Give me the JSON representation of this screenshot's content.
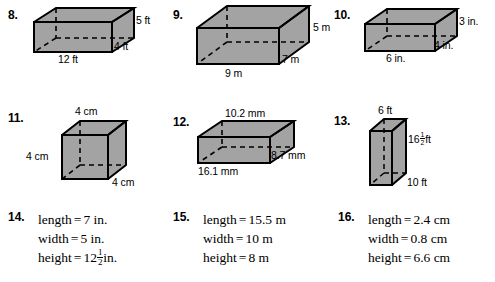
{
  "worksheet": {
    "fill_color": "#a3a3a3",
    "stroke_color": "#000000",
    "problems": [
      {
        "number": "8.",
        "shape": "rectangular-prism",
        "labels": {
          "bottom": "12 ft",
          "right_depth": "4 ft",
          "right_height": "5 ft"
        }
      },
      {
        "number": "9.",
        "shape": "rectangular-prism",
        "labels": {
          "bottom": "9 m",
          "right_depth": "7 m",
          "right_height": "5 m"
        }
      },
      {
        "number": "10.",
        "shape": "rectangular-prism",
        "labels": {
          "bottom": "6 in.",
          "right_depth": "4 in.",
          "right_height": "3 in."
        }
      },
      {
        "number": "11.",
        "shape": "cube",
        "labels": {
          "top": "4 cm",
          "left_height": "4 cm",
          "right_depth": "4 cm"
        }
      },
      {
        "number": "12.",
        "shape": "rectangular-prism",
        "labels": {
          "top": "10.2 mm",
          "bottom": "16.1 mm",
          "right_depth": "8.7 mm"
        }
      },
      {
        "number": "13.",
        "shape": "tall-rectangular-prism",
        "labels": {
          "top": "6 ft",
          "right_height_whole": "16",
          "right_height_num": "1",
          "right_height_den": "2",
          "right_height_unit": "ft",
          "bottom_right": "10 ft"
        }
      }
    ],
    "word_problems": [
      {
        "number": "14.",
        "lines": [
          {
            "label": "length",
            "eq": "=",
            "value": "7 in."
          },
          {
            "label": "width",
            "eq": "=",
            "value": "5 in."
          },
          {
            "label": "height",
            "eq": "=",
            "value_whole": "12",
            "num": "1",
            "den": "2",
            "unit": "in."
          }
        ]
      },
      {
        "number": "15.",
        "lines": [
          {
            "label": "length",
            "eq": "=",
            "value": "15.5 m"
          },
          {
            "label": "width",
            "eq": "=",
            "value": "10 m"
          },
          {
            "label": "height",
            "eq": "=",
            "value": "8 m"
          }
        ]
      },
      {
        "number": "16.",
        "lines": [
          {
            "label": "length",
            "eq": "=",
            "value": "2.4 cm"
          },
          {
            "label": "width",
            "eq": "=",
            "value": "0.8 cm"
          },
          {
            "label": "height",
            "eq": "=",
            "value": "6.6 cm"
          }
        ]
      }
    ]
  }
}
